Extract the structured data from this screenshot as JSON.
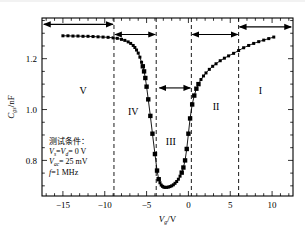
{
  "chart_data": {
    "type": "line",
    "title": "",
    "xlabel": "Vg/V",
    "ylabel": "Cgs/nF",
    "xlim": [
      -17.5,
      12.5
    ],
    "ylim": [
      0.66,
      1.36
    ],
    "xticks": [
      -15,
      -10,
      -5,
      0,
      5,
      10
    ],
    "xticklabels": [
      "−15",
      "−10",
      "−5",
      "0",
      "5",
      "10"
    ],
    "yticks": [
      0.8,
      1.0,
      1.2
    ],
    "yticklabels": [
      "0.8",
      "1.0",
      "1.2"
    ],
    "grid": false,
    "legend": "none",
    "marker": "square",
    "series": [
      {
        "name": "Cgs",
        "x": [
          -15.0,
          -14.4,
          -13.8,
          -13.2,
          -12.6,
          -12.0,
          -11.4,
          -10.8,
          -10.2,
          -9.6,
          -9.0,
          -8.5,
          -8.0,
          -7.6,
          -7.2,
          -6.9,
          -6.6,
          -6.4,
          -6.2,
          -6.0,
          -5.8,
          -5.6,
          -5.45,
          -5.3,
          -5.15,
          -5.0,
          -4.8,
          -4.55,
          -4.3,
          -4.0,
          -3.75,
          -3.55,
          -3.4,
          -3.25,
          -3.1,
          -2.95,
          -2.8,
          -2.6,
          -2.4,
          -2.2,
          -2.0,
          -1.8,
          -1.6,
          -1.4,
          -1.2,
          -1.0,
          -0.8,
          -0.6,
          -0.4,
          -0.2,
          0.0,
          0.2,
          0.45,
          0.7,
          0.95,
          1.2,
          1.5,
          1.8,
          2.1,
          2.5,
          2.9,
          3.3,
          3.8,
          4.3,
          4.8,
          5.4,
          6.0,
          6.6,
          7.2,
          7.8,
          8.4,
          9.0,
          9.6,
          10.2
        ],
        "y": [
          1.29,
          1.29,
          1.289,
          1.289,
          1.288,
          1.288,
          1.287,
          1.286,
          1.285,
          1.284,
          1.282,
          1.28,
          1.276,
          1.272,
          1.266,
          1.26,
          1.252,
          1.244,
          1.234,
          1.222,
          1.206,
          1.186,
          1.17,
          1.15,
          1.124,
          1.09,
          1.04,
          0.975,
          0.905,
          0.825,
          0.76,
          0.726,
          0.712,
          0.703,
          0.698,
          0.695,
          0.694,
          0.694,
          0.695,
          0.697,
          0.7,
          0.704,
          0.71,
          0.717,
          0.726,
          0.738,
          0.752,
          0.772,
          0.8,
          0.845,
          0.905,
          0.965,
          1.02,
          1.055,
          1.082,
          1.1,
          1.118,
          1.132,
          1.144,
          1.158,
          1.17,
          1.18,
          1.192,
          1.202,
          1.211,
          1.221,
          1.232,
          1.243,
          1.252,
          1.26,
          1.267,
          1.273,
          1.279,
          1.285
        ]
      }
    ],
    "vlines": [
      -8.9,
      -3.85,
      0.35,
      6.0
    ],
    "regions": [
      {
        "label": "I",
        "x": 8.6,
        "y": 1.06
      },
      {
        "label": "II",
        "x": 3.3,
        "y": 1.0
      },
      {
        "label": "III",
        "x": -2.1,
        "y": 0.86
      },
      {
        "label": "IV",
        "x": -6.6,
        "y": 0.98
      },
      {
        "label": "V",
        "x": -12.6,
        "y": 1.06
      }
    ],
    "span_arrows": [
      {
        "label": "V-span",
        "x0": -17.4,
        "x1": -8.9,
        "y": 1.335
      },
      {
        "label": "IV-span",
        "x0": -8.9,
        "x1": -3.85,
        "y": 1.295
      },
      {
        "label": "III-span",
        "x0": -3.6,
        "x1": 0.35,
        "y": 1.085
      },
      {
        "label": "II-span",
        "x0": 0.35,
        "x1": 6.0,
        "y": 1.295
      },
      {
        "label": "I-span",
        "x0": 6.0,
        "x1": 12.4,
        "y": 1.325
      }
    ],
    "annotation": {
      "title": "测试条件：",
      "lines": [
        {
          "var": "V",
          "sub": "s",
          "var2": "V",
          "sub2": "d",
          "value": "= 0 V"
        },
        {
          "var": "V",
          "sub": "ac",
          "value": "= 25 mV"
        },
        {
          "var": "f",
          "sub": "",
          "value": "=1 MHz"
        }
      ],
      "line1_text": "Vs=Vd= 0 V",
      "line2_text": "Vac= 25 mV",
      "line3_text": "f=1 MHz"
    }
  },
  "labels": {
    "ylabel_main": "C",
    "ylabel_sub": "gs",
    "ylabel_unit": "/nF",
    "xlabel_main": "V",
    "xlabel_sub": "g",
    "xlabel_unit": "/V"
  },
  "colors": {
    "curve": "#000000",
    "marker": "#000000",
    "frame": "#000000",
    "dashed": "#000000",
    "background": "#ffffff",
    "topbar": "#f2f2f2"
  }
}
